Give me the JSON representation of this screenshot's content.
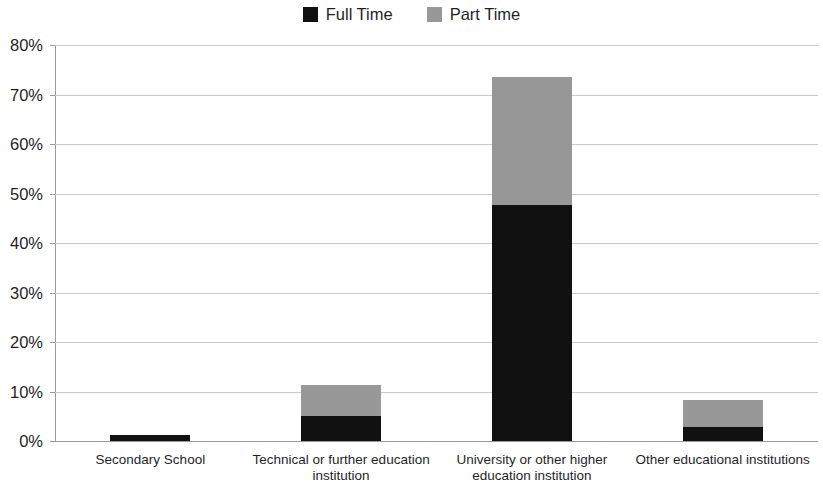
{
  "legend": {
    "items": [
      {
        "label": "Full Time",
        "color": "#111111",
        "swatch_name": "legend-swatch-full-time"
      },
      {
        "label": "Part Time",
        "color": "#989898",
        "swatch_name": "legend-swatch-part-time"
      }
    ]
  },
  "axis": {
    "y_ticks": [
      "0%",
      "10%",
      "20%",
      "30%",
      "40%",
      "50%",
      "60%",
      "70%",
      "80%"
    ]
  },
  "chart_data": {
    "type": "bar",
    "stacked": true,
    "title": "",
    "subtitle": "",
    "xlabel": "",
    "ylabel": "",
    "ylim": [
      0,
      80
    ],
    "ytick_values": [
      0,
      10,
      20,
      30,
      40,
      50,
      60,
      70,
      80
    ],
    "ytick_labels": [
      "0%",
      "10%",
      "20%",
      "30%",
      "40%",
      "50%",
      "60%",
      "70%",
      "80%"
    ],
    "grid": true,
    "legend_position": "top-center",
    "value_suffix": "%",
    "categories": [
      "Secondary School",
      "Technical or further education institution",
      "University or other higher education institution",
      "Other educational institutions"
    ],
    "series": [
      {
        "name": "Full Time",
        "color": "#111111",
        "values": [
          1.3,
          5.0,
          47.7,
          2.9
        ]
      },
      {
        "name": "Part Time",
        "color": "#989898",
        "values": [
          0.0,
          6.3,
          25.8,
          5.4
        ]
      }
    ],
    "totals": [
      1.3,
      11.3,
      73.5,
      8.3
    ]
  }
}
